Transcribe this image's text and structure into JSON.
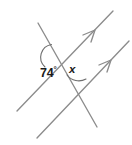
{
  "figure": {
    "type": "geometry-diagram",
    "width": 132,
    "height": 145,
    "background_color": "#ffffff",
    "line_color": "#8c8c8c",
    "text_color": "#1a1a1a"
  },
  "labels": {
    "angle_known_value": "74",
    "angle_known_degree_symbol": "°",
    "angle_unknown_value": "x"
  },
  "elements": {
    "parallel_line_upper_name": "upper-parallel-line",
    "parallel_line_lower_name": "lower-parallel-line",
    "transversal_name": "transversal-line",
    "arrow_marker_upper": "parallel-mark-arrow-upper",
    "arrow_marker_lower": "parallel-mark-arrow-lower",
    "arc_known": "angle-arc-74",
    "arc_unknown": "angle-arc-x"
  },
  "geometry": {
    "upper_parallel": {
      "x1": 17,
      "y1": 111,
      "x2": 113,
      "y2": 11
    },
    "lower_parallel": {
      "x1": 37,
      "y1": 138,
      "x2": 129,
      "y2": 41
    },
    "transversal": {
      "x1": 38,
      "y1": 23,
      "x2": 97,
      "y2": 127
    },
    "intersection_upper": {
      "x": 55,
      "y": 57
    },
    "intersection_lower": {
      "x": 73,
      "y": 88
    },
    "arrow_upper_tip": {
      "x": 94,
      "y": 31
    },
    "arrow_lower_tip": {
      "x": 110,
      "y": 61
    }
  }
}
